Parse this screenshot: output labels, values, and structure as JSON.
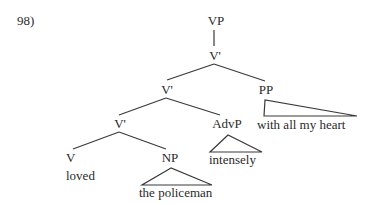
{
  "example_number": "98)",
  "tree": {
    "root": "VP",
    "vbar_top": "V'",
    "vbar_mid": "V'",
    "pp": "PP",
    "pp_text": "with all my heart",
    "vbar_low": "V'",
    "advp": "AdvP",
    "advp_text": "intensely",
    "v": "V",
    "v_text": "loved",
    "np": "NP",
    "np_text": "the policeman"
  },
  "colors": {
    "ink": "#2a2a2a",
    "background": "#ffffff"
  }
}
